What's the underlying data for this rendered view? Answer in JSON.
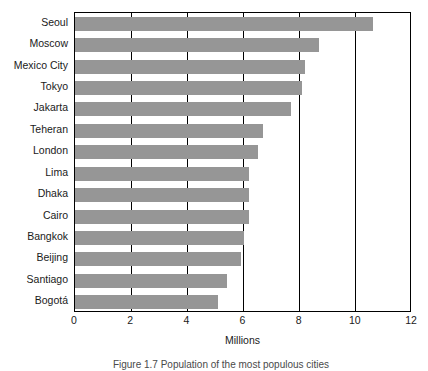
{
  "chart_data": {
    "type": "bar",
    "orientation": "horizontal",
    "title": "",
    "xlabel": "Millions",
    "ylabel": "",
    "xlim": [
      0,
      12
    ],
    "xticks": [
      0,
      2,
      4,
      6,
      8,
      10,
      12
    ],
    "grid": true,
    "gridlines_at": [
      2,
      4,
      6,
      8,
      10
    ],
    "legend": null,
    "bar_color": "#969696",
    "frame_color": "#000000",
    "categories": [
      "Seoul",
      "Moscow",
      "Mexico City",
      "Tokyo",
      "Jakarta",
      "Teheran",
      "London",
      "Lima",
      "Dhaka",
      "Cairo",
      "Bangkok",
      "Beijing",
      "Santiago",
      "Bogotá"
    ],
    "values": [
      10.6,
      8.7,
      8.2,
      8.1,
      7.7,
      6.7,
      6.5,
      6.2,
      6.2,
      6.2,
      6.0,
      5.9,
      5.4,
      5.1
    ]
  },
  "axis": {
    "x_title": "Millions",
    "tick_labels": [
      "0",
      "2",
      "4",
      "6",
      "8",
      "10",
      "12"
    ]
  },
  "caption": {
    "text": "Figure 1.7  Population of the most populous cities"
  }
}
